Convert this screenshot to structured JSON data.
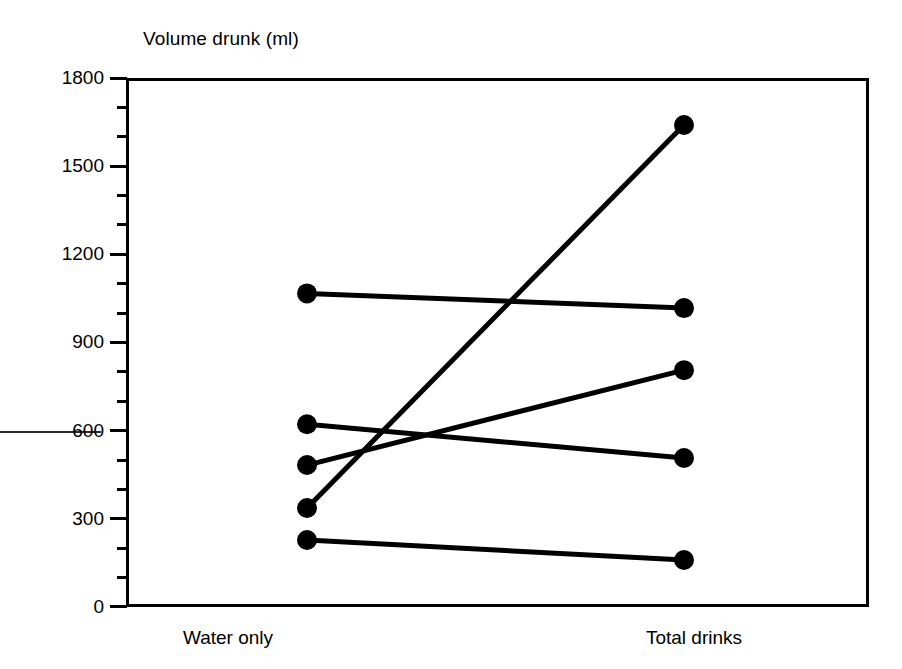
{
  "chart_data": {
    "type": "line",
    "title": "Volume drunk (ml)",
    "xlabel": "",
    "ylabel": "Volume drunk (ml)",
    "categories": [
      "Water only",
      "Total drinks"
    ],
    "x": [
      0,
      1
    ],
    "ylim": [
      0,
      1800
    ],
    "yticks": [
      0,
      300,
      600,
      900,
      1200,
      1500,
      1800
    ],
    "ytick_labels": [
      "0",
      "300",
      "600",
      "900",
      "1200",
      "1500",
      "1800"
    ],
    "minor_tick_interval": 100,
    "grid": false,
    "legend": "none",
    "marker": "filled-circle",
    "series": [
      {
        "name": "subject-1",
        "values": [
          1067,
          1017
        ]
      },
      {
        "name": "subject-2",
        "values": [
          622,
          507
        ]
      },
      {
        "name": "subject-3",
        "values": [
          483,
          806
        ]
      },
      {
        "name": "subject-4",
        "values": [
          337,
          1640
        ]
      },
      {
        "name": "subject-5",
        "values": [
          228,
          160
        ]
      }
    ],
    "colors": {
      "line": "#000000",
      "marker": "#000000",
      "frame": "#000000",
      "background": "#ffffff"
    }
  },
  "axis": {
    "y_tick_labels": [
      "1800",
      "1500",
      "1200",
      "900",
      "600",
      "300",
      "0"
    ],
    "x_tick_labels": [
      "Water only",
      "Total drinks"
    ]
  },
  "title": {
    "text": "Volume drunk (ml)"
  }
}
